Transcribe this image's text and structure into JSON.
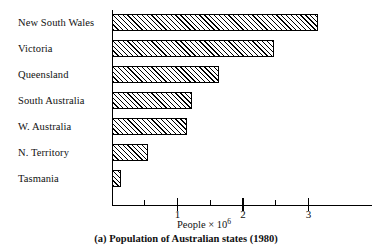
{
  "chart_data": {
    "type": "bar",
    "orientation": "horizontal",
    "title": "",
    "caption": "(a) Population of Australian states (1980)",
    "xlabel": "People × 10",
    "xlabel_exponent": "6",
    "ylabel": "",
    "categories": [
      "New South Wales",
      "Victoria",
      "Queensland",
      "South Australia",
      "W. Australia",
      "N. Territory",
      "Tasmania"
    ],
    "values": [
      3.15,
      2.47,
      1.63,
      1.22,
      1.15,
      0.55,
      0.14
    ],
    "xlim": [
      0,
      3.97
    ],
    "xticks": [
      1,
      2,
      3
    ],
    "xtick_labels": [
      "1",
      "2",
      "3"
    ],
    "xticks_minor": [
      0.5,
      1.5,
      2.5
    ],
    "grid": false,
    "legend": null,
    "bar_fill": "hatched-diagonal",
    "bar_edge_color": "#000000",
    "axis_color": "#000000"
  }
}
